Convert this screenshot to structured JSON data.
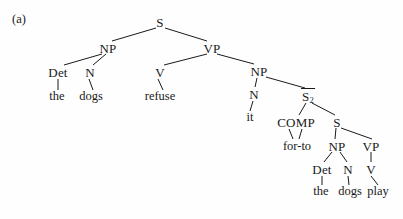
{
  "figure": {
    "panel_label": "(a)",
    "type": "syntax-tree",
    "background_color": "#fefefe",
    "ink_color": "#1a1a1a",
    "sentence_top": "the dogs refuse it for-to the dogs play",
    "nodes": [
      {
        "id": "S",
        "label": "S",
        "x": 160,
        "y": 22
      },
      {
        "id": "NP1",
        "label": "NP",
        "x": 108,
        "y": 48
      },
      {
        "id": "VP1",
        "label": "VP",
        "x": 212,
        "y": 48
      },
      {
        "id": "Det1",
        "label": "Det",
        "x": 58,
        "y": 72
      },
      {
        "id": "N1",
        "label": "N",
        "x": 90,
        "y": 72
      },
      {
        "id": "V1",
        "label": "V",
        "x": 160,
        "y": 72
      },
      {
        "id": "NP2",
        "label": "NP",
        "x": 259,
        "y": 71
      },
      {
        "id": "N2",
        "label": "N",
        "x": 254,
        "y": 94
      },
      {
        "id": "Sbar2",
        "label": "S",
        "x": 308,
        "y": 96,
        "overbar": true,
        "subscript": "2"
      },
      {
        "id": "COMP",
        "label": "COMP",
        "x": 296,
        "y": 122
      },
      {
        "id": "S2",
        "label": "S",
        "x": 337,
        "y": 122
      },
      {
        "id": "NP3",
        "label": "NP",
        "x": 337,
        "y": 146
      },
      {
        "id": "VP2",
        "label": "VP",
        "x": 371,
        "y": 146
      },
      {
        "id": "Det2",
        "label": "Det",
        "x": 322,
        "y": 169
      },
      {
        "id": "N3",
        "label": "N",
        "x": 348,
        "y": 169
      },
      {
        "id": "V2",
        "label": "V",
        "x": 371,
        "y": 169
      }
    ],
    "leaves": [
      {
        "id": "the1",
        "label": "the",
        "x": 57,
        "y": 96
      },
      {
        "id": "dogs1",
        "label": "dogs",
        "x": 91,
        "y": 96
      },
      {
        "id": "refuse",
        "label": "refuse",
        "x": 160,
        "y": 96
      },
      {
        "id": "it",
        "label": "it",
        "x": 250,
        "y": 117
      },
      {
        "id": "for-to",
        "label": "for-to",
        "x": 297,
        "y": 146
      },
      {
        "id": "the2",
        "label": "the",
        "x": 321,
        "y": 191
      },
      {
        "id": "dogs2",
        "label": "dogs",
        "x": 350,
        "y": 191
      },
      {
        "id": "play",
        "label": "play",
        "x": 378,
        "y": 191
      }
    ],
    "edges": [
      {
        "from": "S",
        "to": "NP1",
        "x1": 156,
        "y1": 28,
        "x2": 112,
        "y2": 41
      },
      {
        "from": "S",
        "to": "VP1",
        "x1": 165,
        "y1": 28,
        "x2": 207,
        "y2": 41
      },
      {
        "from": "NP1",
        "to": "Det1",
        "x1": 102,
        "y1": 54,
        "x2": 64,
        "y2": 65
      },
      {
        "from": "NP1",
        "to": "N1",
        "x1": 106,
        "y1": 54,
        "x2": 93,
        "y2": 65
      },
      {
        "from": "VP1",
        "to": "V1",
        "x1": 207,
        "y1": 54,
        "x2": 164,
        "y2": 65
      },
      {
        "from": "VP1",
        "to": "NP2",
        "x1": 217,
        "y1": 54,
        "x2": 254,
        "y2": 64
      },
      {
        "from": "NP2",
        "to": "N2",
        "x1": 257,
        "y1": 78,
        "x2": 255,
        "y2": 87
      },
      {
        "from": "NP2",
        "to": "Sbar2",
        "x1": 266,
        "y1": 77,
        "x2": 305,
        "y2": 88
      },
      {
        "from": "Det1",
        "to": "the1",
        "x1": 58,
        "y1": 79,
        "x2": 58,
        "y2": 90
      },
      {
        "from": "N1",
        "to": "dogs1",
        "x1": 89,
        "y1": 79,
        "x2": 93,
        "y2": 90
      },
      {
        "from": "V1",
        "to": "refuse",
        "x1": 158,
        "y1": 79,
        "x2": 163,
        "y2": 90
      },
      {
        "from": "N2",
        "to": "it",
        "x1": 253,
        "y1": 101,
        "x2": 250,
        "y2": 111
      },
      {
        "from": "Sbar2",
        "to": "COMP",
        "x1": 306,
        "y1": 103,
        "x2": 299,
        "y2": 115
      },
      {
        "from": "Sbar2",
        "to": "S2",
        "x1": 312,
        "y1": 103,
        "x2": 335,
        "y2": 115
      },
      {
        "from": "COMP",
        "to": "for-to",
        "x1": 289,
        "y1": 129,
        "x2": 293,
        "y2": 139
      },
      {
        "from": "COMP",
        "to": "for-to2",
        "x1": 302,
        "y1": 129,
        "x2": 299,
        "y2": 139
      },
      {
        "from": "S2",
        "to": "NP3",
        "x1": 336,
        "y1": 128,
        "x2": 335,
        "y2": 139
      },
      {
        "from": "S2",
        "to": "VP2",
        "x1": 341,
        "y1": 128,
        "x2": 372,
        "y2": 139
      },
      {
        "from": "NP3",
        "to": "Det2",
        "x1": 332,
        "y1": 152,
        "x2": 324,
        "y2": 162
      },
      {
        "from": "NP3",
        "to": "N3",
        "x1": 340,
        "y1": 152,
        "x2": 347,
        "y2": 162
      },
      {
        "from": "VP2",
        "to": "V2",
        "x1": 371,
        "y1": 152,
        "x2": 371,
        "y2": 162
      },
      {
        "from": "Det2",
        "to": "the2",
        "x1": 322,
        "y1": 176,
        "x2": 322,
        "y2": 185
      },
      {
        "from": "N3",
        "to": "dogs2",
        "x1": 348,
        "y1": 176,
        "x2": 349,
        "y2": 185
      },
      {
        "from": "V2",
        "to": "play",
        "x1": 371,
        "y1": 176,
        "x2": 378,
        "y2": 185
      }
    ]
  }
}
